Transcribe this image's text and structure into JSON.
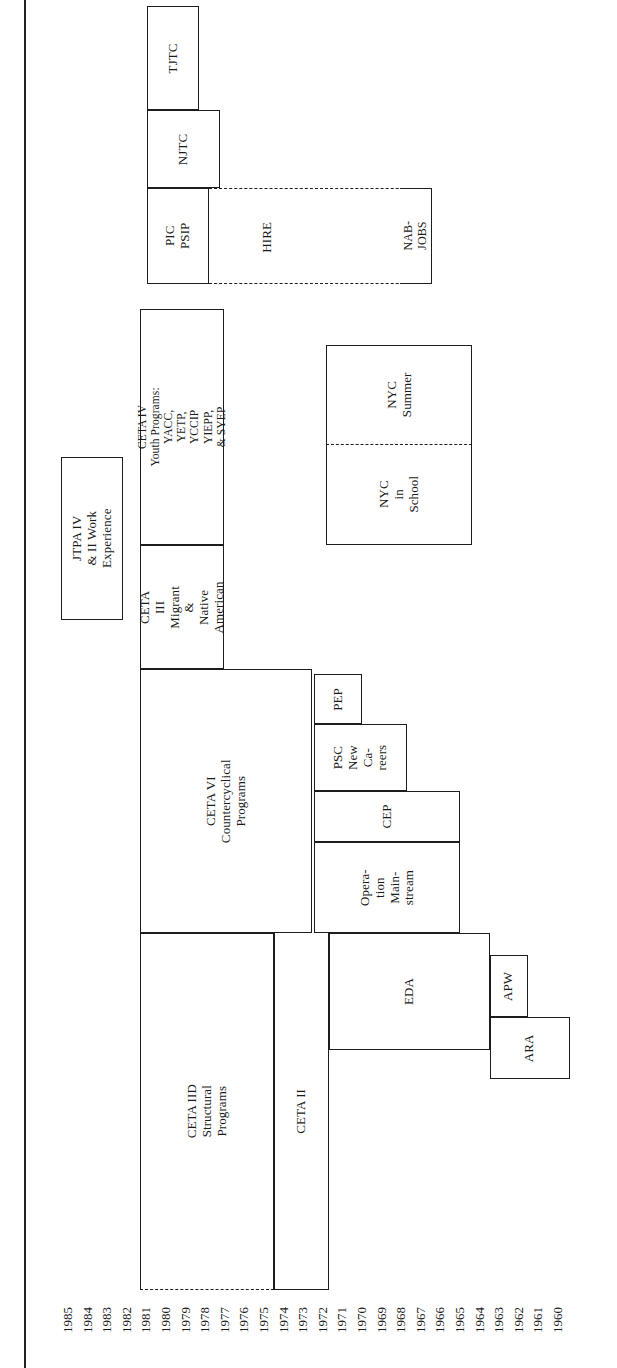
{
  "figure": {
    "type": "timeline-gantt",
    "orientation": "rotated-90-ccw",
    "title": ""
  },
  "axis": {
    "label": "",
    "years": [
      "1985",
      "1984",
      "1983",
      "1982",
      "1981",
      "1980",
      "1979",
      "1978",
      "1977",
      "1976",
      "1975",
      "1974",
      "1973",
      "1972",
      "1971",
      "1970",
      "1969",
      "1968",
      "1967",
      "1966",
      "1965",
      "1964",
      "1963",
      "1962",
      "1961",
      "1960"
    ],
    "year_start": 1960,
    "year_end": 1985
  },
  "chart_data": {
    "type": "bar",
    "title": "",
    "xlabel": "",
    "ylabel": "",
    "categories": [
      "TJTC",
      "NJTC",
      "PIC PSIP",
      "HIRE",
      "NAB-JOBS",
      "JTPA IV & II Work Experience",
      "CETA IV Youth Programs",
      "CETA III Migrant & Native American",
      "NYC Summer",
      "NYC in School",
      "CETA VI Countercyclical Programs",
      "PEP",
      "PSC New Careers",
      "CEP",
      "Operation Mainstream",
      "CETA IID Structural Programs",
      "CETA II",
      "EDA",
      "APW",
      "ARA"
    ],
    "values": [
      1985,
      1981,
      1985,
      1980,
      1973,
      1985,
      1982,
      1982,
      1975,
      1975,
      1981,
      1973,
      1973,
      1974,
      1975,
      1985,
      1976,
      1975,
      1965,
      1964
    ],
    "series": [
      {
        "name": "start_year",
        "values": [
          1979,
          1977,
          1978,
          1975,
          1968,
          1983,
          1978,
          1974,
          1965,
          1965,
          1975,
          1971,
          1967,
          1967,
          1965,
          1974,
          1974,
          1966,
          1963,
          1961
        ]
      },
      {
        "name": "end_year",
        "values": [
          1985,
          1981,
          1985,
          1980,
          1973,
          1985,
          1982,
          1982,
          1975,
          1975,
          1981,
          1973,
          1973,
          1974,
          1975,
          1985,
          1976,
          1975,
          1965,
          1964
        ]
      }
    ]
  },
  "blocks": [
    {
      "id": "tjtc",
      "label": "TJTC"
    },
    {
      "id": "njtc",
      "label": "NJTC"
    },
    {
      "id": "pic_psip",
      "label": "PIC\nPSIP"
    },
    {
      "id": "hire",
      "label": "HIRE"
    },
    {
      "id": "nabjobs",
      "label": "NAB-\nJOBS"
    },
    {
      "id": "jtpa",
      "label": "JTPA IV\n& II Work\nExperience"
    },
    {
      "id": "ceta4",
      "label": "CETA IV\nYouth Programs:\nYACC,\nYETP,\nYCCIP\nYIEPP,\n& SYEP"
    },
    {
      "id": "ceta3",
      "label": "CETA\nIII\nMigrant\n&\nNative\nAmerican"
    },
    {
      "id": "nyc_summer",
      "label": "NYC\nSummer"
    },
    {
      "id": "nyc_school",
      "label": "NYC\nin\nSchool"
    },
    {
      "id": "ceta6",
      "label": "CETA VI\nCountercyclical\nPrograms"
    },
    {
      "id": "pep",
      "label": "PEP"
    },
    {
      "id": "psc",
      "label": "PSC\nNew\nCa-\nreers"
    },
    {
      "id": "cep",
      "label": "CEP"
    },
    {
      "id": "opmain",
      "label": "Opera-\ntion\nMain-\nstream"
    },
    {
      "id": "ceta2d",
      "label": "CETA IID\nStructural\nPrograms"
    },
    {
      "id": "ceta2",
      "label": "CETA II"
    },
    {
      "id": "eda",
      "label": "EDA"
    },
    {
      "id": "apw",
      "label": "APW"
    },
    {
      "id": "ara",
      "label": "ARA"
    }
  ],
  "colors": {
    "stroke": "#1d1d1d",
    "background": "#ffffff",
    "text": "#1a1a1a"
  }
}
